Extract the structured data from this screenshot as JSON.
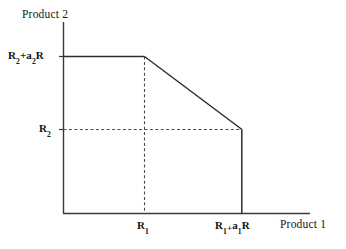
{
  "figure": {
    "kind": "production-possibility-frontier-diagram",
    "background_color": "#ffffff",
    "line_color": "#333333",
    "text_color": "#141414",
    "axes": {
      "x_title": "Product 1",
      "y_title": "Product 2",
      "x_ticks": [
        {
          "id": "r1",
          "label_html": "R<sub>1</sub>",
          "value_text": "R1"
        },
        {
          "id": "r1_plus_a1r",
          "label_html": "R<sub>1</sub><span class=\"lowplus\">+</span>a<sub>1</sub>R",
          "value_text": "R1+a1R"
        }
      ],
      "y_ticks": [
        {
          "id": "r2_plus_a2r",
          "label_html": "R<sub>2</sub>+a<sub>2</sub>R",
          "value_text": "R2+a2R"
        },
        {
          "id": "r2",
          "label_html": "R<sub>2</sub>",
          "value_text": "R2"
        }
      ]
    }
  },
  "chart_data": {
    "type": "line",
    "title": "",
    "xlabel": "Product 1",
    "ylabel": "Product 2",
    "xlim": [
      0,
      1
    ],
    "ylim": [
      0,
      1
    ],
    "grid": false,
    "legend": "none",
    "x_tick_labels": [
      "R1",
      "R1+a1R"
    ],
    "y_tick_labels": [
      "R2",
      "R2+a2R"
    ],
    "series": [
      {
        "name": "frontier",
        "style": "solid",
        "points": [
          {
            "x": "0",
            "y": "R2+a2R"
          },
          {
            "x": "R1",
            "y": "R2+a2R"
          },
          {
            "x": "R1+a1R",
            "y": "R2"
          },
          {
            "x": "R1+a1R",
            "y": "0"
          }
        ]
      },
      {
        "name": "guide-horizontal-R2",
        "style": "dashed",
        "points": [
          {
            "x": "0",
            "y": "R2"
          },
          {
            "x": "R1+a1R",
            "y": "R2"
          }
        ]
      },
      {
        "name": "guide-vertical-R1",
        "style": "dashed",
        "points": [
          {
            "x": "R1",
            "y": "R2+a2R"
          },
          {
            "x": "R1",
            "y": "0"
          }
        ]
      }
    ],
    "annotations": []
  }
}
